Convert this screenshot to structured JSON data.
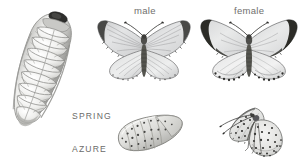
{
  "plate": {
    "title": "Spring Azure life cycle plate",
    "background_color": "#ffffff",
    "ink_color": "#6f6f6d",
    "medium": "graphite-pencil-illustration"
  },
  "labels": {
    "male": "male",
    "female": "female",
    "species_line1": "SPRING",
    "species_line2": "AZURE"
  },
  "figures": [
    {
      "id": "caterpillar",
      "name": "caterpillar",
      "stage": "larva",
      "orientation": "diagonal, head upper-right",
      "description": "plump segmented sluglike larva with dark head capsule and ridged fleshy segments",
      "colors": {
        "body": "#e9e9e7",
        "shadow": "#a9a9a6",
        "head": "#2f2f2d"
      }
    },
    {
      "id": "male-butterfly",
      "name": "male-butterfly",
      "stage": "adult",
      "view": "dorsal, wings spread",
      "description": "pale blue-grey wings with narrow dark forewing apex and fine dark wing fringes",
      "colors": {
        "wing": "#dedfe0",
        "border": "#3a3a38",
        "body": "#4a4a47"
      }
    },
    {
      "id": "female-butterfly",
      "name": "female-butterfly",
      "stage": "adult",
      "view": "dorsal, wings spread",
      "description": "pale wings with broad black forewing apex borders and spotted hindwing margins",
      "colors": {
        "wing": "#dedfe0",
        "border": "#1f1f1e",
        "body": "#4a4a47"
      }
    },
    {
      "id": "chrysalis",
      "name": "chrysalis",
      "stage": "pupa",
      "orientation": "horizontal",
      "description": "rounded oval pupa, speckled with dark flecks and banded abdominal segments",
      "colors": {
        "body": "#dcdcd9",
        "speckle": "#474745"
      }
    },
    {
      "id": "underside-butterfly",
      "name": "underside-butterfly",
      "stage": "adult",
      "view": "lateral, wings closed",
      "description": "perched butterfly showing pale speckled underside with marginal dots and legs",
      "colors": {
        "wing": "#e3e3e1",
        "speckle": "#3c3c3a"
      }
    }
  ]
}
